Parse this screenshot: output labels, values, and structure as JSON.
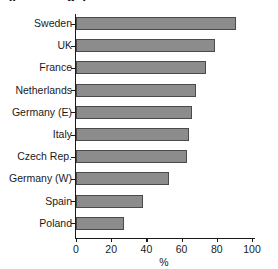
{
  "chart_data": {
    "type": "bar",
    "orientation": "horizontal",
    "title": "(percentage)",
    "categories": [
      "Sweden",
      "UK",
      "France",
      "Netherlands",
      "Germany (E)",
      "Italy",
      "Czech Rep.",
      "Germany (W)",
      "Spain",
      "Poland"
    ],
    "values": [
      91,
      79,
      74,
      68,
      66,
      64,
      63,
      53,
      38,
      27
    ],
    "xlabel": "%",
    "ylabel": "",
    "xlim": [
      0,
      100
    ],
    "xticks": [
      0,
      20,
      40,
      60,
      80,
      100
    ],
    "xtick_labels": [
      "0",
      "20",
      "40",
      "60",
      "80",
      "100"
    ],
    "grid": false,
    "legend": false,
    "bar_color": "#8c8c8c",
    "bar_edge_color": "#4a4a4a",
    "axis_color": "#1a1a1a",
    "background": "#ffffff"
  }
}
